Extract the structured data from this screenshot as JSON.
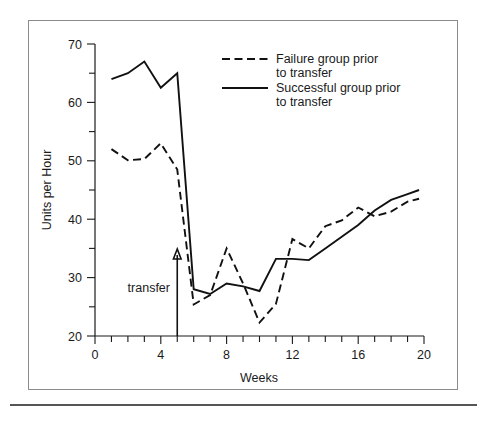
{
  "chart_data": {
    "type": "line",
    "title": "",
    "xlabel": "Weeks",
    "ylabel": "Units per Hour",
    "xlim": [
      0,
      20
    ],
    "ylim": [
      20,
      70
    ],
    "grid": false,
    "legend_position": "top-right",
    "x_ticks_major": [
      0,
      4,
      8,
      12,
      16,
      20
    ],
    "x_ticks_minor": [
      1,
      2,
      3,
      5,
      6,
      7,
      9,
      10,
      11,
      13,
      14,
      15,
      17,
      18,
      19
    ],
    "y_ticks_major": [
      20,
      30,
      40,
      50,
      60,
      70
    ],
    "y_ticks_minor": [
      25,
      35,
      45,
      55,
      65
    ],
    "x": [
      1,
      2,
      3,
      4,
      5,
      6,
      7,
      8,
      9,
      10,
      11,
      12,
      13,
      14,
      15,
      16,
      17,
      18,
      19,
      19.7
    ],
    "series": [
      {
        "name": "Failure group prior to transfer",
        "style": "dashed",
        "values": [
          52.0,
          50.1,
          50.3,
          53.0,
          48.5,
          25.4,
          27.0,
          35.0,
          29.0,
          22.3,
          25.5,
          36.6,
          35.0,
          38.8,
          39.8,
          42.0,
          40.5,
          41.3,
          43.0,
          43.5
        ]
      },
      {
        "name": "Successful group prior to transfer",
        "style": "solid",
        "values": [
          64.0,
          65.0,
          67.0,
          62.5,
          65.0,
          28.0,
          27.2,
          29.0,
          28.5,
          27.7,
          33.2,
          33.2,
          33.0,
          35.0,
          37.0,
          39.0,
          41.5,
          43.3,
          44.3,
          45.0
        ]
      }
    ],
    "annotations": [
      {
        "label": "transfer",
        "x": 5,
        "type": "arrow-up",
        "arrow_from_y": 20,
        "arrow_to_y": 34.5
      }
    ]
  },
  "axis": {
    "y_label": "Units per Hour",
    "x_label": "Weeks",
    "y_tick_labels": [
      "70",
      "60",
      "50",
      "40",
      "30",
      "20"
    ],
    "x_tick_labels": [
      "0",
      "4",
      "8",
      "12",
      "16",
      "20"
    ]
  },
  "legend": {
    "entries": [
      {
        "line1": "Failure group prior",
        "line2": "to transfer",
        "style": "dashed"
      },
      {
        "line1": "Successful group prior",
        "line2": "to transfer",
        "style": "solid"
      }
    ]
  },
  "annotation": {
    "transfer_label": "transfer"
  },
  "colors": {
    "ink": "#111111",
    "frame": "#8c8c8c",
    "rule": "#555555",
    "background": "#ffffff"
  }
}
